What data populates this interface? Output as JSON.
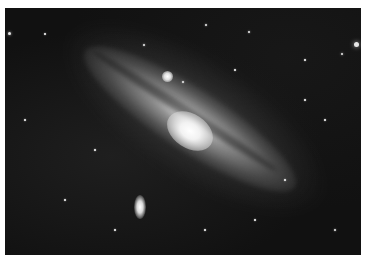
{
  "image": {
    "subject": "Andromeda galaxy (spiral galaxy) with two satellite galaxies in a star field",
    "color_mode": "grayscale",
    "border_color": "#ffffff",
    "background_color": "#0e0e0e"
  },
  "stars": [
    {
      "x": 4,
      "y": 33,
      "r": 1.5
    },
    {
      "x": 351,
      "y": 44,
      "r": 2.5
    },
    {
      "x": 337,
      "y": 54,
      "r": 1.2
    },
    {
      "x": 139,
      "y": 45,
      "r": 1
    },
    {
      "x": 201,
      "y": 25,
      "r": 1
    },
    {
      "x": 244,
      "y": 32,
      "r": 1
    },
    {
      "x": 178,
      "y": 82,
      "r": 1
    },
    {
      "x": 40,
      "y": 34,
      "r": 0.8
    },
    {
      "x": 300,
      "y": 60,
      "r": 0.8
    },
    {
      "x": 320,
      "y": 120,
      "r": 0.8
    },
    {
      "x": 60,
      "y": 200,
      "r": 0.8
    },
    {
      "x": 250,
      "y": 220,
      "r": 0.8
    },
    {
      "x": 330,
      "y": 230,
      "r": 1
    },
    {
      "x": 20,
      "y": 120,
      "r": 0.8
    },
    {
      "x": 90,
      "y": 150,
      "r": 0.8
    },
    {
      "x": 280,
      "y": 180,
      "r": 0.8
    },
    {
      "x": 200,
      "y": 230,
      "r": 0.8
    },
    {
      "x": 110,
      "y": 230,
      "r": 0.8
    },
    {
      "x": 300,
      "y": 100,
      "r": 0.8
    },
    {
      "x": 230,
      "y": 70,
      "r": 0.8
    }
  ]
}
